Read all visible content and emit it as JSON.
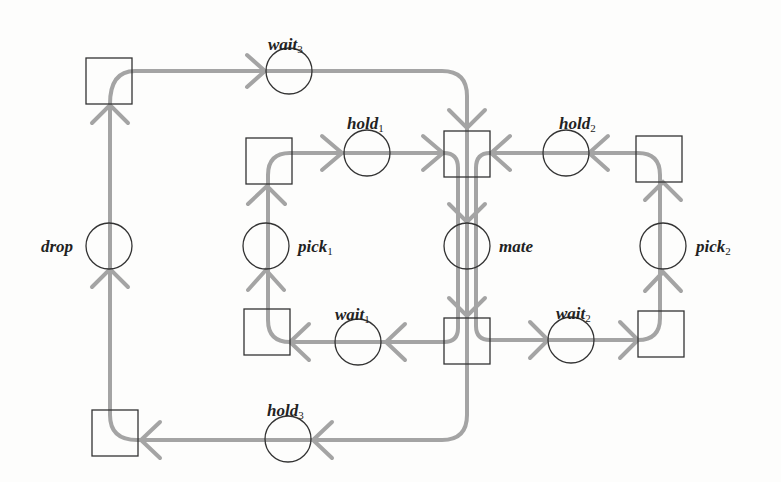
{
  "diagram": {
    "type": "petri-net",
    "colors": {
      "arc": "#a4a4a4",
      "node_stroke": "#333333",
      "label": "#222222"
    },
    "places": [
      {
        "id": "wait3",
        "base": "wait",
        "sub": "3",
        "cx": 289,
        "cy": 71
      },
      {
        "id": "hold1",
        "base": "hold",
        "sub": "1",
        "cx": 367,
        "cy": 153
      },
      {
        "id": "hold2",
        "base": "hold",
        "sub": "2",
        "cx": 566,
        "cy": 153
      },
      {
        "id": "drop",
        "base": "drop",
        "sub": "",
        "cx": 109,
        "cy": 246
      },
      {
        "id": "pick1",
        "base": "pick",
        "sub": "1",
        "cx": 266,
        "cy": 246
      },
      {
        "id": "mate",
        "base": "mate",
        "sub": "",
        "cx": 467,
        "cy": 246
      },
      {
        "id": "pick2",
        "base": "pick",
        "sub": "2",
        "cx": 663,
        "cy": 246
      },
      {
        "id": "wait1",
        "base": "wait",
        "sub": "1",
        "cx": 358,
        "cy": 342
      },
      {
        "id": "wait2",
        "base": "wait",
        "sub": "2",
        "cx": 571,
        "cy": 340
      },
      {
        "id": "hold3",
        "base": "hold",
        "sub": "3",
        "cx": 288,
        "cy": 439
      }
    ],
    "transitions": [
      {
        "id": "t-top-left",
        "x": 86,
        "y": 58
      },
      {
        "id": "t-pick1-top",
        "x": 246,
        "y": 138
      },
      {
        "id": "t-mate-top",
        "x": 444,
        "y": 131
      },
      {
        "id": "t-pick2-top",
        "x": 636,
        "y": 136
      },
      {
        "id": "t-pick1-bottom",
        "x": 244,
        "y": 309
      },
      {
        "id": "t-mate-bottom",
        "x": 444,
        "y": 318
      },
      {
        "id": "t-pick2-bottom",
        "x": 638,
        "y": 311
      },
      {
        "id": "t-bottom-left",
        "x": 92,
        "y": 410
      }
    ],
    "labels": [
      {
        "place": "wait3",
        "base": "wait",
        "sub": "3",
        "x": 268,
        "y": 36
      },
      {
        "place": "hold1",
        "base": "hold",
        "sub": "1",
        "x": 347,
        "y": 115
      },
      {
        "place": "hold2",
        "base": "hold",
        "sub": "2",
        "x": 559,
        "y": 115
      },
      {
        "place": "drop",
        "base": "drop",
        "sub": "",
        "x": 41,
        "y": 238
      },
      {
        "place": "pick1",
        "base": "pick",
        "sub": "1",
        "x": 298,
        "y": 238
      },
      {
        "place": "mate",
        "base": "mate",
        "sub": "",
        "x": 499,
        "y": 238
      },
      {
        "place": "pick2",
        "base": "pick",
        "sub": "2",
        "x": 696,
        "y": 238
      },
      {
        "place": "wait1",
        "base": "wait",
        "sub": "1",
        "x": 335,
        "y": 306
      },
      {
        "place": "wait2",
        "base": "wait",
        "sub": "2",
        "x": 556,
        "y": 305
      },
      {
        "place": "hold3",
        "base": "hold",
        "sub": "3",
        "x": 267,
        "y": 402
      }
    ]
  }
}
